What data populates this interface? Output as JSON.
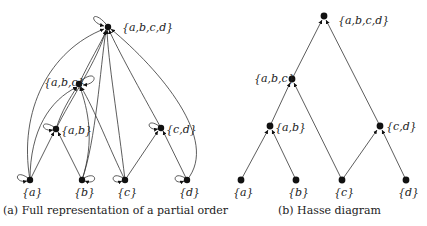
{
  "figure": {
    "panel_a": {
      "caption": "(a) Full representation of a partial order",
      "nodes": [
        {
          "id": "abcd",
          "label": "{a,b,c,d}"
        },
        {
          "id": "abc",
          "label": "{a,b,c}"
        },
        {
          "id": "ab",
          "label": "{a,b}"
        },
        {
          "id": "cd",
          "label": "{c,d}"
        },
        {
          "id": "a",
          "label": "{a}"
        },
        {
          "id": "b",
          "label": "{b}"
        },
        {
          "id": "c",
          "label": "{c}"
        },
        {
          "id": "d",
          "label": "{d}"
        }
      ],
      "edges": "all subset relations including reflexive self-loops"
    },
    "panel_b": {
      "caption": "(b) Hasse diagram",
      "nodes": [
        {
          "id": "abcd",
          "label": "{a,b,c,d}"
        },
        {
          "id": "abc",
          "label": "{a,b,c}"
        },
        {
          "id": "ab",
          "label": "{a,b}"
        },
        {
          "id": "cd",
          "label": "{c,d}"
        },
        {
          "id": "a",
          "label": "{a}"
        },
        {
          "id": "b",
          "label": "{b}"
        },
        {
          "id": "c",
          "label": "{c}"
        },
        {
          "id": "d",
          "label": "{d}"
        }
      ],
      "edges": [
        [
          "a",
          "ab"
        ],
        [
          "b",
          "ab"
        ],
        [
          "ab",
          "abc"
        ],
        [
          "c",
          "abc"
        ],
        [
          "c",
          "cd"
        ],
        [
          "d",
          "cd"
        ],
        [
          "abc",
          "abcd"
        ],
        [
          "cd",
          "abcd"
        ]
      ]
    }
  }
}
